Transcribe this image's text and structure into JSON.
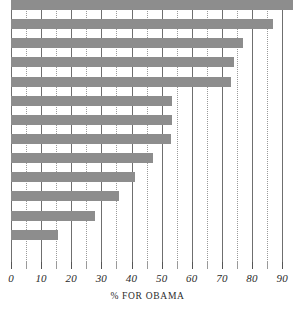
{
  "chart_data": {
    "type": "bar",
    "orientation": "horizontal",
    "title": "",
    "subtitle": "",
    "xlabel": "% FOR OBAMA",
    "ylabel": "",
    "xlim": [
      0,
      93.6
    ],
    "ylim": [
      0,
      14
    ],
    "grid": true,
    "grid_major_step": 10,
    "grid_minor_step": 5,
    "legend": null,
    "legend_position": "none",
    "bar_color": "#8d8d8d",
    "gridline_color": "#6f6f6f",
    "minor_gridline_color": "#9a9a9a",
    "axis_text_color": "#2b2b2b",
    "xticks": [
      0,
      10,
      20,
      30,
      40,
      50,
      60,
      70,
      80,
      90
    ],
    "xticklabels": [
      "0",
      "10",
      "20",
      "30",
      "40",
      "50",
      "60",
      "70",
      "80",
      "90"
    ],
    "minor_xticks": [
      5,
      15,
      25,
      35,
      45,
      55,
      65,
      75,
      85
    ],
    "categories": [
      "",
      "",
      "",
      "",
      "",
      "",
      "",
      "",
      "",
      "",
      "",
      "",
      "",
      ""
    ],
    "values": [
      93.5,
      87,
      77,
      74,
      73,
      53.5,
      53.5,
      53,
      47,
      41,
      36,
      28,
      15.5,
      0
    ],
    "bars": [
      {
        "index": 1,
        "label": "",
        "value": 93.5
      },
      {
        "index": 2,
        "label": "",
        "value": 87
      },
      {
        "index": 3,
        "label": "",
        "value": 77
      },
      {
        "index": 4,
        "label": "",
        "value": 74
      },
      {
        "index": 5,
        "label": "",
        "value": 73
      },
      {
        "index": 6,
        "label": "",
        "value": 53.5
      },
      {
        "index": 7,
        "label": "",
        "value": 53.5
      },
      {
        "index": 8,
        "label": "",
        "value": 53
      },
      {
        "index": 9,
        "label": "",
        "value": 47
      },
      {
        "index": 10,
        "label": "",
        "value": 41
      },
      {
        "index": 11,
        "label": "",
        "value": 36
      },
      {
        "index": 12,
        "label": "",
        "value": 28
      },
      {
        "index": 13,
        "label": "",
        "value": 15.5
      },
      {
        "index": 14,
        "label": "",
        "value": 0
      }
    ]
  },
  "axis": {
    "x_title": "% FOR OBAMA"
  }
}
